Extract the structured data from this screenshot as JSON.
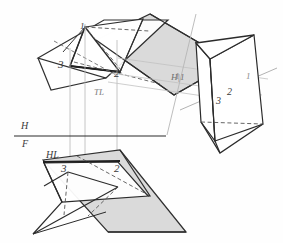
{
  "drawing": {
    "title": "Descriptive geometry: triangular prism, plane intersection, orthographic and auxiliary views",
    "palette": {
      "paper": "#fefefe",
      "ink_heavy": "#2b2b2b",
      "ink_medium": "#4a4a4a",
      "ink_light": "#9a9a9a",
      "projector_gray": "#bdbdbd",
      "fill_gray": "#d6d6d6",
      "fill_gray_light": "#dedede",
      "fill_white": "#ffffff",
      "label_color": "#3a3a3a"
    }
  },
  "labels": {
    "top_view": {
      "vertex_1": "1",
      "vertex_2": "2",
      "vertex_3": "3",
      "true_length": "TL"
    },
    "auxiliary_view": {
      "vertex_1_left": "1",
      "vertex_1_right": "1",
      "vertex_2": "2",
      "vertex_3": "3"
    },
    "front_view": {
      "vertex_2": "2",
      "vertex_3": "3",
      "horizontal_line": "HL"
    },
    "reference_lines": {
      "h_over_f_top": "H",
      "h_over_f_bottom": "F",
      "h_to_1": "H|1"
    }
  },
  "geometry": {
    "top_view": {
      "plane_quad": "96,40 150,14 232,62 174,95",
      "plane_quad_2": "48,72 106,21 172,22 116,77",
      "triangle_123": "84,28 124,72 70,66",
      "prism_outline": "84,28 124,72 70,66 96,40 150,14 116,77"
    },
    "front_view": {
      "plane_quad": "43,159 119,150 185,233 108,233",
      "prism_body": "43,163 118,160 148,194 63,200"
    },
    "auxiliary_view": {
      "prism_outline": "196,42 230,31 252,67 237,145 205,122"
    },
    "projection_lines": [
      {
        "x": 70,
        "y1": 48,
        "y2": 186
      },
      {
        "x": 85,
        "y1": 22,
        "y2": 186
      },
      {
        "x": 117,
        "y1": 40,
        "y2": 186
      }
    ],
    "hf_line": {
      "x1": 14,
      "y1": 136,
      "x2": 165,
      "y2": 136
    },
    "h1_line": {
      "x1": 196,
      "y1": 16,
      "x2": 168,
      "y2": 133
    }
  }
}
